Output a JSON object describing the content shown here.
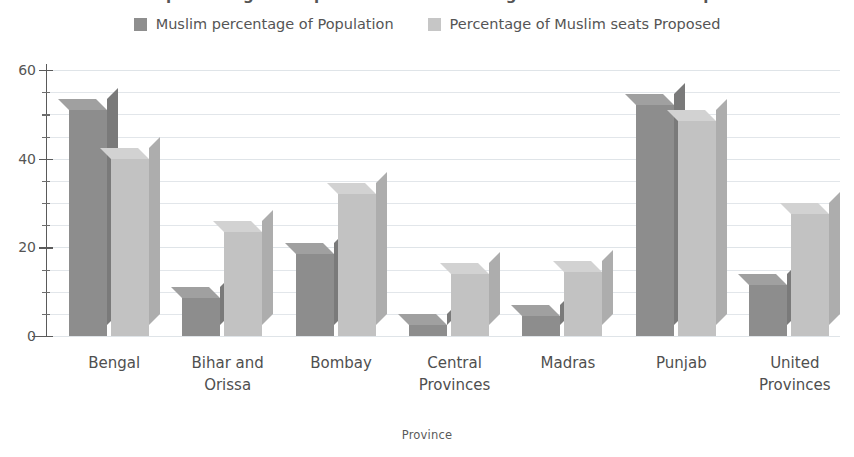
{
  "title": "Muslim percentage of Population and Percentage of Muslim seats Proposed",
  "x_axis_title": "Province",
  "legend": {
    "items": [
      {
        "label": "Muslim percentage of Population",
        "color": "#8d8d8d"
      },
      {
        "label": "Percentage of Muslim seats Proposed",
        "color": "#c2c2c2"
      }
    ]
  },
  "y_axis": {
    "ticks": [
      "0",
      "20",
      "40",
      "60"
    ],
    "tick_values": [
      0,
      20,
      40,
      60
    ],
    "minor_step": 5,
    "min": 0,
    "max": 60
  },
  "chart_data": {
    "type": "bar",
    "title": "Muslim percentage of Population and Percentage of Muslim seats Proposed",
    "xlabel": "Province",
    "ylabel": "",
    "ylim": [
      0,
      60
    ],
    "yticks": [
      0,
      20,
      40,
      60
    ],
    "grid": true,
    "legend_position": "top",
    "categories": [
      "Bengal",
      "Bihar and\nOrissa",
      "Bombay",
      "Central\nProvinces",
      "Madras",
      "Punjab",
      "United\nProvinces"
    ],
    "series": [
      {
        "name": "Muslim percentage of Population",
        "color": "#8d8d8d",
        "values": [
          51,
          8.5,
          18.5,
          2.5,
          4.5,
          52,
          11.5
        ]
      },
      {
        "name": "Percentage of Muslim seats Proposed",
        "color": "#c2c2c2",
        "values": [
          40,
          23.5,
          32,
          14,
          14.5,
          48.5,
          27.5
        ]
      }
    ]
  }
}
